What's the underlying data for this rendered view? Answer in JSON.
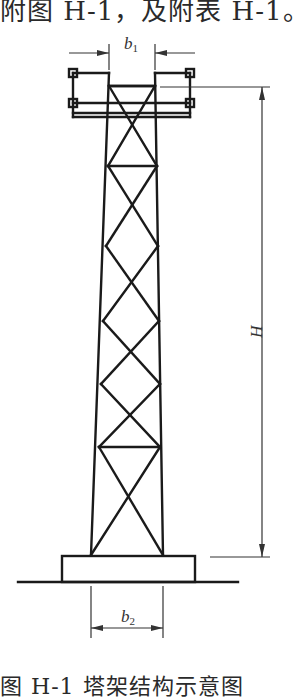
{
  "header_text": "附图 H-1，及附表 H-1。",
  "footer_text": "图 H-1  塔架结构示意图",
  "diagram": {
    "labels": {
      "top_width": "b",
      "top_width_sub": "1",
      "height": "H",
      "base_width": "b",
      "base_width_sub": "2"
    },
    "colors": {
      "line": "#1a1a1a",
      "dimension": "#333333",
      "background": "#ffffff"
    },
    "elements": [
      "platform",
      "lattice-tower",
      "foundation-block",
      "ground-line",
      "dimension-b1",
      "dimension-H",
      "dimension-b2"
    ]
  }
}
